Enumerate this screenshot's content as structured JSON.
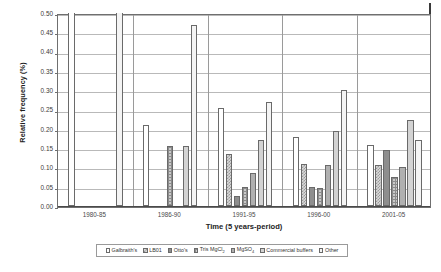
{
  "chart_data": {
    "type": "bar",
    "title": "",
    "subtitle": "",
    "xlabel": "Time (5 years-period)",
    "ylabel": "Relative frequency (%)",
    "categories": [
      "1980-85",
      "1986-90",
      "1991-95",
      "1996-00",
      "2001-05"
    ],
    "ylim": [
      0.0,
      0.5
    ],
    "yticks": [
      "0.00",
      "0.05",
      "0.10",
      "0.15",
      "0.20",
      "0.25",
      "0.30",
      "0.35",
      "0.40",
      "0.45",
      "0.50"
    ],
    "ytick_values": [
      0.0,
      0.05,
      0.1,
      0.15,
      0.2,
      0.25,
      0.3,
      0.35,
      0.4,
      0.45,
      0.5
    ],
    "grid": true,
    "legend_position": "bottom",
    "series": [
      {
        "name": "Galbraith's",
        "pattern": "solid-white",
        "values": [
          0.5,
          0.21,
          0.255,
          0.18,
          0.158
        ]
      },
      {
        "name": "LB01",
        "pattern": "checker",
        "values": [
          0.0,
          0.0,
          0.135,
          0.11,
          0.107
        ]
      },
      {
        "name": "Otto's",
        "pattern": "solid-dark",
        "values": [
          0.0,
          0.0,
          0.025,
          0.05,
          0.145
        ]
      },
      {
        "name": "Tris MgCl2",
        "pattern": "grid-hatch",
        "values": [
          0.0,
          0.155,
          0.05,
          0.046,
          0.076
        ]
      },
      {
        "name": "MgSO4",
        "pattern": "solid-mid",
        "values": [
          0.0,
          0.0,
          0.085,
          0.105,
          0.1
        ]
      },
      {
        "name": "Commercial buffers",
        "pattern": "solid-light",
        "values": [
          0.0,
          0.155,
          0.17,
          0.195,
          0.222
        ]
      },
      {
        "name": "Other",
        "pattern": "solid-pale",
        "values": [
          0.5,
          0.47,
          0.27,
          0.3,
          0.17
        ]
      }
    ],
    "legend": [
      {
        "label_html": "Galbraith's"
      },
      {
        "label_html": "LB01"
      },
      {
        "label_html": "Otto's"
      },
      {
        "label_html": "Tris MgCl<sub>2</sub>"
      },
      {
        "label_html": "MgSO<sub>4</sub>"
      },
      {
        "label_html": "Commercial buffers"
      },
      {
        "label_html": "Other"
      }
    ]
  }
}
